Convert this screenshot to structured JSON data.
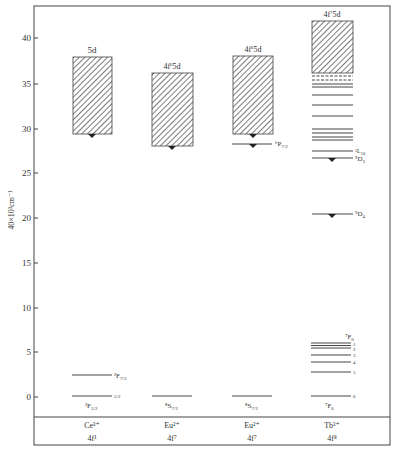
{
  "diagram": {
    "type": "energy-level-diagram",
    "y_axis": {
      "label": "40×10³cm⁻¹",
      "ticks": [
        0,
        5,
        10,
        15,
        20,
        25,
        30,
        35,
        40
      ],
      "range": [
        0,
        44
      ]
    },
    "columns": [
      {
        "ion": "Ce³⁺",
        "config": "4f¹",
        "band": {
          "label": "5d",
          "bottom": 29.2,
          "top": 38.0
        },
        "levels": [
          {
            "label": "²F₇/₂",
            "energy": 2.4
          },
          {
            "label": "²F₅/₂",
            "energy": 0,
            "side_label": "5/2"
          }
        ],
        "emitting_marker": 29.2
      },
      {
        "ion": "Eu²⁺",
        "config": "4f⁷",
        "band": {
          "label": "4f⁶5d",
          "bottom": 27.9,
          "top": 36.2
        },
        "levels": [
          {
            "label": "⁸S₇/₂",
            "energy": 0
          }
        ],
        "emitting_marker": 27.9
      },
      {
        "ion": "Eu²⁺",
        "config": "4f⁷",
        "band": {
          "label": "4f⁶5d",
          "bottom": 29.2,
          "top": 38.0
        },
        "levels": [
          {
            "label": "⁶P₇/₂",
            "energy": 28.1
          },
          {
            "label": "⁸S₇/₂",
            "energy": 0
          }
        ],
        "emitting_marker": 28.1
      },
      {
        "ion": "Tb³⁺",
        "config": "4f⁸",
        "band": {
          "label": "4f⁷5d",
          "bottom": 36.0,
          "top": 41.9
        },
        "levels": [
          {
            "label": "",
            "energy": 35.6,
            "style": "dashed"
          },
          {
            "label": "",
            "energy": 35.2,
            "style": "dashed"
          },
          {
            "label": "",
            "energy": 34.7
          },
          {
            "label": "",
            "energy": 34.4
          },
          {
            "label": "",
            "energy": 33.4
          },
          {
            "label": "",
            "energy": 32.3
          },
          {
            "label": "",
            "energy": 31.1
          },
          {
            "label": "",
            "energy": 29.6
          },
          {
            "label": "",
            "energy": 29.2
          },
          {
            "label": "",
            "energy": 28.8
          },
          {
            "label": "",
            "energy": 28.4
          },
          {
            "label": "⁵L₁₀",
            "energy": 27.2
          },
          {
            "label": "⁵D₃",
            "energy": 26.4
          },
          {
            "label": "⁵D₄",
            "energy": 20.4
          },
          {
            "label": "⁷F₀ / 0",
            "energy": 5.9
          },
          {
            "label": "1",
            "energy": 5.7
          },
          {
            "label": "2",
            "energy": 5.4
          },
          {
            "label": "3",
            "energy": 4.6
          },
          {
            "label": "4",
            "energy": 3.8
          },
          {
            "label": "5",
            "energy": 2.7
          },
          {
            "label": "⁷F₆ / 6",
            "energy": 0
          }
        ],
        "emitting_markers": [
          26.4,
          20.4
        ]
      }
    ]
  },
  "labels": {
    "y_axis_title": "40×10³cm⁻¹",
    "tick_0": "0",
    "tick_5": "5",
    "tick_10": "10",
    "tick_15": "15",
    "tick_20": "20",
    "tick_25": "25",
    "tick_30": "30",
    "tick_35": "35",
    "tick_40": "40",
    "ce_band": "5d",
    "ce_ion": "Ce³⁺",
    "ce_config": "4f¹",
    "ce_upper_base": "²F",
    "ce_upper_sub": "7/2",
    "ce_lower_base": "²F",
    "ce_lower_sub": "5/2",
    "ce_lower_side": "5/2",
    "eu1_band_base": "4f",
    "eu1_band_sup": "6",
    "eu1_band_tail": "5d",
    "eu1_ion": "Eu²⁺",
    "eu1_config": "4f⁷",
    "eu1_ground_base": "⁸S",
    "eu1_ground_sub": "7/2",
    "eu2_band_base": "4f",
    "eu2_band_sup": "6",
    "eu2_band_tail": "5d",
    "eu2_ion": "Eu²⁺",
    "eu2_config": "4f⁷",
    "eu2_level_base": "⁶P",
    "eu2_level_sub": "7/2",
    "eu2_ground_base": "⁸S",
    "eu2_ground_sub": "7/2",
    "tb_band_base": "4f",
    "tb_band_sup": "7",
    "tb_band_tail": "5d",
    "tb_ion": "Tb³⁺",
    "tb_config": "4f⁸",
    "tb_L10_base": "⁵L",
    "tb_L10_sub": "10",
    "tb_D3_base": "⁵D",
    "tb_D3_sub": "3",
    "tb_D4_base": "⁵D",
    "tb_D4_sub": "4",
    "tb_F0_base": "⁷F",
    "tb_F0_sub": "0",
    "tb_F6_base": "⁷F",
    "tb_F6_sub": "6",
    "tb_j1": "1",
    "tb_j2": "2",
    "tb_j3": "3",
    "tb_j4": "4",
    "tb_j5": "5",
    "tb_j6": "6"
  }
}
